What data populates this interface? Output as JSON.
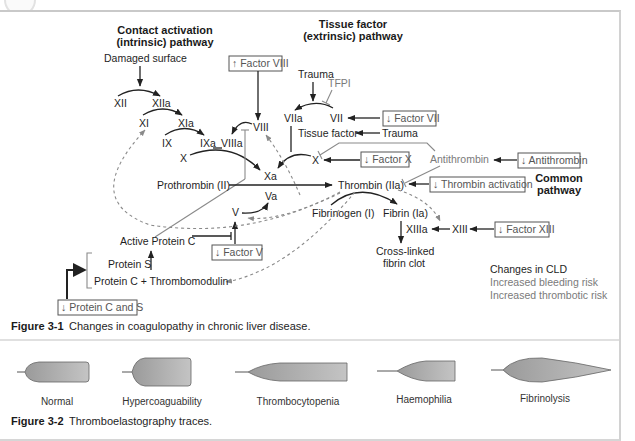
{
  "figure1": {
    "headings": {
      "intrinsic_line1": "Contact activation",
      "intrinsic_line2": "(intrinsic) pathway",
      "extrinsic_line1": "Tissue factor",
      "extrinsic_line2": "(extrinsic) pathway",
      "common_line1": "Common",
      "common_line2": "pathway"
    },
    "nodes": {
      "damaged_surface": "Damaged surface",
      "xii": "XII",
      "xiia": "XIIa",
      "xi": "XI",
      "xia": "XIa",
      "ix": "IX",
      "ixa": "IXa",
      "viiia": "VIIIa",
      "viii": "VIII",
      "x_intrinsic": "X",
      "xa": "Xa",
      "prothrombin": "Prothrombin (II)",
      "va": "Va",
      "v": "V",
      "trauma_top": "Trauma",
      "tfpi": "TFPI",
      "viia": "VIIa",
      "vii": "VII",
      "tissue_factor": "Tissue factor",
      "trauma_right": "Trauma",
      "x_extrinsic": "X",
      "antithrombin": "Antithrombin",
      "thrombin": "Thrombin (IIa)",
      "fibrinogen": "Fibrinogen (I)",
      "fibrin": "Fibrin (Ia)",
      "xiiia": "XIIIa",
      "xiii": "XIII",
      "clot_line1": "Cross-linked",
      "clot_line2": "fibrin clot",
      "active_protein_c": "Active Protein C",
      "protein_s": "Protein S",
      "protein_c_thrombomodulin": "Protein C + Thrombomodulin"
    },
    "change_boxes": {
      "factor_viii": "↑ Factor VIII",
      "factor_vii": "↓ Factor VII",
      "factor_x": "↓ Factor X",
      "antithrombin": "↓ Antithrombin",
      "thrombin_activation": "↓ Thrombin activation",
      "factor_xiii": "↓ Factor XIII",
      "factor_v": "↓ Factor V",
      "protein_c_and_s": "↓ Protein C and S"
    },
    "legend": {
      "title": "Changes in CLD",
      "bleeding": "Increased bleeding risk",
      "thrombotic": "Increased thrombotic risk"
    },
    "caption_label": "Figure 3-1",
    "caption_text": "Changes in coagulopathy in chronic liver disease."
  },
  "figure2": {
    "traces": [
      {
        "label": "Normal"
      },
      {
        "label": "Hypercoaguability"
      },
      {
        "label": "Thrombocytopenia"
      },
      {
        "label": "Haemophilia"
      },
      {
        "label": "Fibrinolysis"
      }
    ],
    "caption_label": "Figure 3-2",
    "caption_text": "Thromboelastography traces."
  },
  "colors": {
    "text": "#1e1e1e",
    "grey_text": "#7a7a7a",
    "trace_fill": "#a9a9a9",
    "border": "#c9c9c9"
  }
}
